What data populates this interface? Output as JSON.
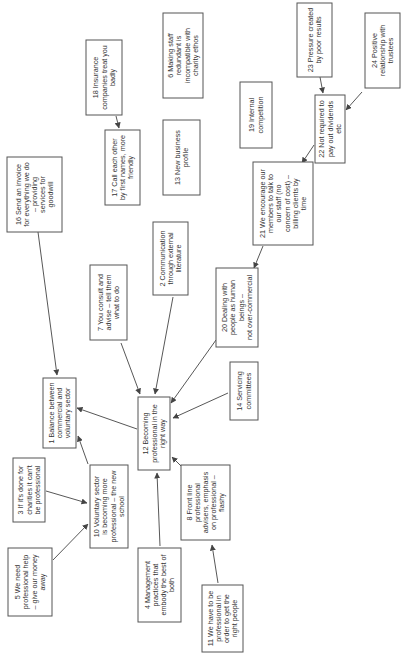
{
  "diagram": {
    "orientation": "rotated-90-ccw",
    "colors": {
      "border": "#555555",
      "text": "#333333",
      "edge": "#444444",
      "background": "#ffffff"
    },
    "nodes": [
      {
        "id": "1",
        "x": 43,
        "y": 378,
        "w": 33,
        "h": 70,
        "lines": [
          "1 Balance between",
          "commercial and",
          "voluntary sector"
        ]
      },
      {
        "id": "2",
        "x": 153,
        "y": 222,
        "w": 35,
        "h": 73,
        "lines": [
          "2 Communication",
          "through external",
          "literature"
        ]
      },
      {
        "id": "3",
        "x": 13,
        "y": 458,
        "w": 32,
        "h": 64,
        "lines": [
          "3 If it's done for",
          "charities it can't",
          "be professional"
        ]
      },
      {
        "id": "4",
        "x": 138,
        "y": 548,
        "w": 43,
        "h": 74,
        "lines": [
          "4 Management",
          "practices that",
          "embody the best of",
          "both"
        ]
      },
      {
        "id": "5",
        "x": 8,
        "y": 548,
        "w": 44,
        "h": 68,
        "lines": [
          "5 We need",
          "professional help",
          "– give our money",
          "away"
        ]
      },
      {
        "id": "6",
        "x": 163,
        "y": 13,
        "w": 40,
        "h": 85,
        "lines": [
          "6 Making staff",
          "redundant is",
          "incompatible with",
          "charity ethos"
        ]
      },
      {
        "id": "7",
        "x": 90,
        "y": 265,
        "w": 37,
        "h": 75,
        "lines": [
          "7 You consult and",
          "advise – tell them",
          "what to do"
        ]
      },
      {
        "id": "8",
        "x": 181,
        "y": 465,
        "w": 49,
        "h": 75,
        "lines": [
          "8 Front line",
          "professional",
          "advisers, emphasis",
          "on professional –",
          "flashy"
        ]
      },
      {
        "id": "10",
        "x": 90,
        "y": 465,
        "w": 38,
        "h": 83,
        "lines": [
          "10 Voluntary sector",
          "is becoming more",
          "professional – the new",
          "school"
        ]
      },
      {
        "id": "11",
        "x": 202,
        "y": 585,
        "w": 41,
        "h": 67,
        "lines": [
          "11 We have to be",
          "professional in",
          "order to get the",
          "right people"
        ]
      },
      {
        "id": "12",
        "x": 138,
        "y": 397,
        "w": 32,
        "h": 73,
        "lines": [
          "12 Becoming",
          "professional in the",
          "right way"
        ]
      },
      {
        "id": "13",
        "x": 163,
        "y": 120,
        "w": 37,
        "h": 75,
        "lines": [
          "13 New business",
          "profile"
        ]
      },
      {
        "id": "14",
        "x": 230,
        "y": 362,
        "w": 28,
        "h": 58,
        "lines": [
          "14 Servicing",
          "committees"
        ]
      },
      {
        "id": "16",
        "x": 7,
        "y": 157,
        "w": 55,
        "h": 75,
        "lines": [
          "16 Send an invoice",
          "for everything we do",
          "– providing",
          "services for",
          "goodwill"
        ]
      },
      {
        "id": "17",
        "x": 105,
        "y": 130,
        "w": 35,
        "h": 75,
        "lines": [
          "17 Call each other",
          "by first names, more",
          "friendly"
        ]
      },
      {
        "id": "18",
        "x": 86,
        "y": 40,
        "w": 36,
        "h": 75,
        "lines": [
          "18 Insurance",
          "companies treat you",
          "badly"
        ]
      },
      {
        "id": "19",
        "x": 240,
        "y": 82,
        "w": 32,
        "h": 66,
        "lines": [
          "19 Internal",
          "competition"
        ]
      },
      {
        "id": "20",
        "x": 216,
        "y": 268,
        "w": 42,
        "h": 79,
        "lines": [
          "20 Dealing with",
          "people as human",
          "beings –",
          "not over-commercial"
        ]
      },
      {
        "id": "21",
        "x": 253,
        "y": 162,
        "w": 60,
        "h": 83,
        "lines": [
          "21 We encourage our",
          "members to talk to",
          "our staff (no",
          "concern of cost) –",
          "billing clients by",
          "time"
        ]
      },
      {
        "id": "22",
        "x": 315,
        "y": 95,
        "w": 30,
        "h": 68,
        "lines": [
          "22 Not required to",
          "pay out dividends",
          "etc"
        ]
      },
      {
        "id": "23",
        "x": 297,
        "y": 3,
        "w": 35,
        "h": 74,
        "lines": [
          "23 Pressure created",
          "by poor results"
        ]
      },
      {
        "id": "24",
        "x": 365,
        "y": 13,
        "w": 35,
        "h": 75,
        "lines": [
          "24 Positive",
          "relationship with",
          "trustees"
        ]
      }
    ],
    "edges": [
      {
        "from": "18",
        "to": "17",
        "x1": 116,
        "y1": 116,
        "x2": 119,
        "y2": 128
      },
      {
        "from": "16",
        "to": "1",
        "x1": 38,
        "y1": 232,
        "x2": 57,
        "y2": 375
      },
      {
        "from": "23",
        "to": "22",
        "x1": 320,
        "y1": 77,
        "x2": 323,
        "y2": 93
      },
      {
        "from": "24",
        "to": "22",
        "x1": 362,
        "y1": 92,
        "x2": 346,
        "y2": 110
      },
      {
        "from": "22",
        "to": "21",
        "x1": 314,
        "y1": 145,
        "x2": 302,
        "y2": 163
      },
      {
        "from": "21",
        "to": "20",
        "x1": 263,
        "y1": 246,
        "x2": 254,
        "y2": 268
      },
      {
        "from": "7",
        "to": "12",
        "x1": 121,
        "y1": 343,
        "x2": 140,
        "y2": 394
      },
      {
        "from": "2",
        "to": "12",
        "x1": 173,
        "y1": 297,
        "x2": 155,
        "y2": 394
      },
      {
        "from": "20",
        "to": "12",
        "x1": 216,
        "y1": 340,
        "x2": 171,
        "y2": 403
      },
      {
        "from": "14",
        "to": "12",
        "x1": 228,
        "y1": 393,
        "x2": 173,
        "y2": 418
      },
      {
        "from": "12",
        "to": "1",
        "x1": 137,
        "y1": 429,
        "x2": 77,
        "y2": 408
      },
      {
        "from": "10",
        "to": "1",
        "x1": 88,
        "y1": 464,
        "x2": 78,
        "y2": 436
      },
      {
        "from": "3",
        "to": "10",
        "x1": 46,
        "y1": 491,
        "x2": 87,
        "y2": 503
      },
      {
        "from": "5",
        "to": "10",
        "x1": 53,
        "y1": 560,
        "x2": 88,
        "y2": 524
      },
      {
        "from": "4",
        "to": "12",
        "x1": 160,
        "y1": 546,
        "x2": 157,
        "y2": 473
      },
      {
        "from": "8",
        "to": "12",
        "x1": 183,
        "y1": 468,
        "x2": 172,
        "y2": 457
      },
      {
        "from": "11",
        "to": "8",
        "x1": 218,
        "y1": 583,
        "x2": 212,
        "y2": 545
      }
    ]
  }
}
